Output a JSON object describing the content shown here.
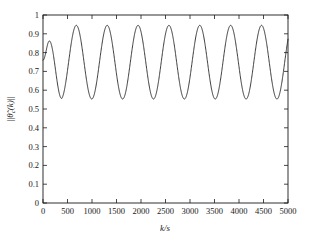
{
  "chart_data": {
    "type": "line",
    "title": "",
    "xlabel": "k/s",
    "ylabel": "||θ̃c(k)||",
    "ylabel_parts": {
      "bars_left": "||",
      "theta": "θ",
      "tilde": "̃",
      "subscript": "c",
      "arg": "(k)",
      "bars_right": "||"
    },
    "xlim": [
      0,
      5000
    ],
    "ylim": [
      0,
      1
    ],
    "xticks": [
      0,
      500,
      1000,
      1500,
      2000,
      2500,
      3000,
      3500,
      4000,
      4500,
      5000
    ],
    "xtick_labels": [
      "0",
      "500",
      "1000",
      "1500",
      "2000",
      "2500",
      "3000",
      "3500",
      "4000",
      "4500",
      "5000"
    ],
    "yticks": [
      0,
      0.1,
      0.2,
      0.3,
      0.4,
      0.5,
      0.6,
      0.7,
      0.8,
      0.9,
      1
    ],
    "ytick_labels": [
      "0",
      "0.1",
      "0.2",
      "0.3",
      "0.4",
      "0.5",
      "0.6",
      "0.7",
      "0.8",
      "0.9",
      "1"
    ],
    "grid": false,
    "legend": null,
    "legend_position": "none",
    "line_color": "#1a1a1a",
    "series": [
      {
        "name": "parameter-error-norm",
        "oscillation": {
          "peak_value": 0.945,
          "trough_value": 0.553,
          "period": 630,
          "first_peak_x": 680,
          "initial_value": 0.76,
          "initial_peak_value": 0.862,
          "initial_peak_x": 130,
          "initial_trough_value": 0.556,
          "initial_trough_x": 380,
          "num_full_peaks": 8,
          "final_value": 0.87
        },
        "x": [
          0,
          60,
          130,
          200,
          260,
          320,
          380,
          440,
          500,
          560,
          620,
          680,
          740,
          800,
          860,
          920,
          995,
          1060,
          1130,
          1190,
          1250,
          1310,
          1370,
          1430,
          1500,
          1560,
          1625,
          1690,
          1755,
          1820,
          1880,
          1940,
          2000,
          2060,
          2130,
          2190,
          2255,
          2320,
          2385,
          2450,
          2510,
          2570,
          2630,
          2690,
          2760,
          2820,
          2885,
          2950,
          3015,
          3080,
          3140,
          3200,
          3260,
          3320,
          3390,
          3450,
          3515,
          3580,
          3645,
          3710,
          3770,
          3830,
          3890,
          3950,
          4020,
          4080,
          4145,
          4210,
          4275,
          4340,
          4400,
          4460,
          4520,
          4580,
          4650,
          4710,
          4775,
          4840,
          4905,
          4970,
          5000
        ],
        "y": [
          0.76,
          0.83,
          0.862,
          0.83,
          0.74,
          0.64,
          0.566,
          0.556,
          0.6,
          0.7,
          0.82,
          0.92,
          0.945,
          0.93,
          0.86,
          0.76,
          0.635,
          0.574,
          0.553,
          0.585,
          0.67,
          0.78,
          0.885,
          0.94,
          0.945,
          0.9,
          0.8,
          0.69,
          0.6,
          0.556,
          0.556,
          0.6,
          0.69,
          0.8,
          0.9,
          0.945,
          0.94,
          0.885,
          0.78,
          0.67,
          0.585,
          0.553,
          0.574,
          0.635,
          0.76,
          0.86,
          0.93,
          0.945,
          0.92,
          0.82,
          0.7,
          0.6,
          0.556,
          0.566,
          0.64,
          0.74,
          0.84,
          0.92,
          0.945,
          0.925,
          0.855,
          0.755,
          0.65,
          0.575,
          0.553,
          0.58,
          0.665,
          0.775,
          0.88,
          0.94,
          0.945,
          0.905,
          0.81,
          0.7,
          0.605,
          0.556,
          0.556,
          0.605,
          0.7,
          0.815,
          0.87
        ]
      }
    ]
  }
}
